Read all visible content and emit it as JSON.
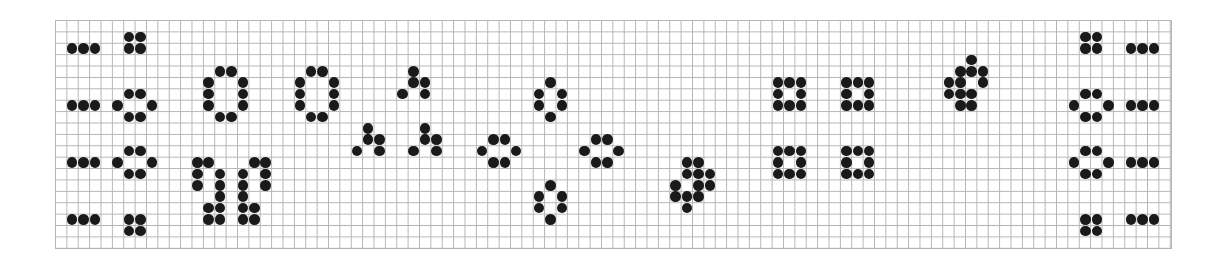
{
  "board": {
    "columns": 98,
    "rows": 20,
    "cell_width": 11.388,
    "cell_height": 11.4,
    "grid_color": "#b4b4b4",
    "live_color": "#1a1a1a",
    "background": "#ffffff"
  },
  "patterns": [
    {
      "name": "blinker-left-1",
      "cells": [
        [
          2,
          1
        ],
        [
          2,
          2
        ],
        [
          2,
          3
        ]
      ]
    },
    {
      "name": "block-left-1",
      "cells": [
        [
          1,
          6
        ],
        [
          1,
          7
        ],
        [
          2,
          6
        ],
        [
          2,
          7
        ]
      ]
    },
    {
      "name": "blinker-left-2",
      "cells": [
        [
          7,
          1
        ],
        [
          7,
          2
        ],
        [
          7,
          3
        ]
      ]
    },
    {
      "name": "beehive-left-2",
      "cells": [
        [
          6,
          6
        ],
        [
          6,
          7
        ],
        [
          7,
          5
        ],
        [
          7,
          8
        ],
        [
          8,
          6
        ],
        [
          8,
          7
        ]
      ]
    },
    {
      "name": "blinker-left-3",
      "cells": [
        [
          12,
          1
        ],
        [
          12,
          2
        ],
        [
          12,
          3
        ]
      ]
    },
    {
      "name": "beehive-left-3",
      "cells": [
        [
          11,
          6
        ],
        [
          11,
          7
        ],
        [
          12,
          5
        ],
        [
          12,
          8
        ],
        [
          13,
          6
        ],
        [
          13,
          7
        ]
      ]
    },
    {
      "name": "blinker-left-4",
      "cells": [
        [
          17,
          1
        ],
        [
          17,
          2
        ],
        [
          17,
          3
        ]
      ]
    },
    {
      "name": "block-left-4",
      "cells": [
        [
          17,
          6
        ],
        [
          17,
          7
        ],
        [
          18,
          6
        ],
        [
          18,
          7
        ]
      ]
    },
    {
      "name": "pond-ring-1",
      "cells": [
        [
          4,
          14
        ],
        [
          4,
          15
        ],
        [
          5,
          13
        ],
        [
          5,
          16
        ],
        [
          6,
          13
        ],
        [
          6,
          16
        ],
        [
          7,
          13
        ],
        [
          7,
          16
        ],
        [
          8,
          14
        ],
        [
          8,
          15
        ]
      ]
    },
    {
      "name": "pond-ring-2",
      "cells": [
        [
          4,
          22
        ],
        [
          4,
          23
        ],
        [
          5,
          21
        ],
        [
          5,
          24
        ],
        [
          6,
          21
        ],
        [
          6,
          24
        ],
        [
          7,
          21
        ],
        [
          7,
          24
        ],
        [
          8,
          22
        ],
        [
          8,
          23
        ]
      ]
    },
    {
      "name": "hook-pair",
      "cells": [
        [
          12,
          12
        ],
        [
          12,
          13
        ],
        [
          13,
          12
        ],
        [
          13,
          14
        ],
        [
          14,
          12
        ],
        [
          14,
          14
        ],
        [
          15,
          14
        ],
        [
          16,
          13
        ],
        [
          16,
          14
        ],
        [
          17,
          13
        ],
        [
          17,
          14
        ],
        [
          12,
          17
        ],
        [
          12,
          18
        ],
        [
          13,
          16
        ],
        [
          13,
          18
        ],
        [
          14,
          16
        ],
        [
          14,
          18
        ],
        [
          15,
          16
        ],
        [
          16,
          16
        ],
        [
          16,
          17
        ],
        [
          17,
          16
        ],
        [
          17,
          17
        ]
      ]
    },
    {
      "name": "tri-top",
      "cells": [
        [
          4,
          31
        ],
        [
          5,
          31
        ],
        [
          5,
          32
        ],
        [
          6,
          30
        ],
        [
          6,
          32
        ]
      ]
    },
    {
      "name": "tri-bottom-left",
      "cells": [
        [
          9,
          27
        ],
        [
          10,
          27
        ],
        [
          10,
          28
        ],
        [
          11,
          26
        ],
        [
          11,
          28
        ]
      ]
    },
    {
      "name": "tri-bottom-right",
      "cells": [
        [
          9,
          32
        ],
        [
          10,
          32
        ],
        [
          10,
          33
        ],
        [
          11,
          31
        ],
        [
          11,
          33
        ]
      ]
    },
    {
      "name": "beehive-vertical-top",
      "cells": [
        [
          5,
          43
        ],
        [
          6,
          42
        ],
        [
          6,
          44
        ],
        [
          7,
          42
        ],
        [
          7,
          44
        ],
        [
          8,
          43
        ]
      ]
    },
    {
      "name": "beehive-horizontal-left",
      "cells": [
        [
          10,
          38
        ],
        [
          10,
          39
        ],
        [
          11,
          37
        ],
        [
          11,
          40
        ],
        [
          12,
          38
        ],
        [
          12,
          39
        ]
      ]
    },
    {
      "name": "beehive-horizontal-right",
      "cells": [
        [
          10,
          47
        ],
        [
          10,
          48
        ],
        [
          11,
          46
        ],
        [
          11,
          49
        ],
        [
          12,
          47
        ],
        [
          12,
          48
        ]
      ]
    },
    {
      "name": "beehive-vertical-bottom",
      "cells": [
        [
          14,
          43
        ],
        [
          15,
          42
        ],
        [
          15,
          44
        ],
        [
          16,
          42
        ],
        [
          16,
          44
        ],
        [
          17,
          43
        ]
      ]
    },
    {
      "name": "blob-lower",
      "cells": [
        [
          12,
          55
        ],
        [
          12,
          56
        ],
        [
          13,
          55
        ],
        [
          13,
          56
        ],
        [
          13,
          57
        ],
        [
          14,
          54
        ],
        [
          14,
          56
        ],
        [
          14,
          57
        ],
        [
          15,
          54
        ],
        [
          15,
          55
        ],
        [
          15,
          56
        ],
        [
          16,
          55
        ]
      ]
    },
    {
      "name": "hollow-square-1",
      "cells": [
        [
          5,
          63
        ],
        [
          5,
          64
        ],
        [
          5,
          65
        ],
        [
          6,
          63
        ],
        [
          6,
          65
        ],
        [
          7,
          63
        ],
        [
          7,
          64
        ],
        [
          7,
          65
        ]
      ]
    },
    {
      "name": "hollow-square-2",
      "cells": [
        [
          5,
          69
        ],
        [
          5,
          70
        ],
        [
          5,
          71
        ],
        [
          6,
          69
        ],
        [
          6,
          71
        ],
        [
          7,
          69
        ],
        [
          7,
          70
        ],
        [
          7,
          71
        ]
      ]
    },
    {
      "name": "hollow-square-3",
      "cells": [
        [
          11,
          63
        ],
        [
          11,
          64
        ],
        [
          11,
          65
        ],
        [
          12,
          63
        ],
        [
          12,
          65
        ],
        [
          13,
          63
        ],
        [
          13,
          64
        ],
        [
          13,
          65
        ]
      ]
    },
    {
      "name": "hollow-square-4",
      "cells": [
        [
          11,
          69
        ],
        [
          11,
          70
        ],
        [
          11,
          71
        ],
        [
          12,
          69
        ],
        [
          12,
          71
        ],
        [
          13,
          69
        ],
        [
          13,
          70
        ],
        [
          13,
          71
        ]
      ]
    },
    {
      "name": "blob-upper",
      "cells": [
        [
          3,
          80
        ],
        [
          4,
          79
        ],
        [
          4,
          80
        ],
        [
          4,
          81
        ],
        [
          5,
          78
        ],
        [
          5,
          79
        ],
        [
          5,
          81
        ],
        [
          6,
          78
        ],
        [
          6,
          79
        ],
        [
          6,
          80
        ],
        [
          7,
          79
        ],
        [
          7,
          80
        ]
      ]
    },
    {
      "name": "block-right-1",
      "cells": [
        [
          1,
          90
        ],
        [
          1,
          91
        ],
        [
          2,
          90
        ],
        [
          2,
          91
        ]
      ]
    },
    {
      "name": "blinker-right-1",
      "cells": [
        [
          2,
          94
        ],
        [
          2,
          95
        ],
        [
          2,
          96
        ]
      ]
    },
    {
      "name": "beehive-right-2",
      "cells": [
        [
          6,
          90
        ],
        [
          6,
          91
        ],
        [
          7,
          89
        ],
        [
          7,
          92
        ],
        [
          8,
          90
        ],
        [
          8,
          91
        ]
      ]
    },
    {
      "name": "blinker-right-2",
      "cells": [
        [
          7,
          94
        ],
        [
          7,
          95
        ],
        [
          7,
          96
        ]
      ]
    },
    {
      "name": "beehive-right-3",
      "cells": [
        [
          11,
          90
        ],
        [
          11,
          91
        ],
        [
          12,
          89
        ],
        [
          12,
          92
        ],
        [
          13,
          90
        ],
        [
          13,
          91
        ]
      ]
    },
    {
      "name": "blinker-right-3",
      "cells": [
        [
          12,
          94
        ],
        [
          12,
          95
        ],
        [
          12,
          96
        ]
      ]
    },
    {
      "name": "block-right-4",
      "cells": [
        [
          17,
          90
        ],
        [
          17,
          91
        ],
        [
          18,
          90
        ],
        [
          18,
          91
        ]
      ]
    },
    {
      "name": "blinker-right-4",
      "cells": [
        [
          17,
          94
        ],
        [
          17,
          95
        ],
        [
          17,
          96
        ]
      ]
    }
  ]
}
